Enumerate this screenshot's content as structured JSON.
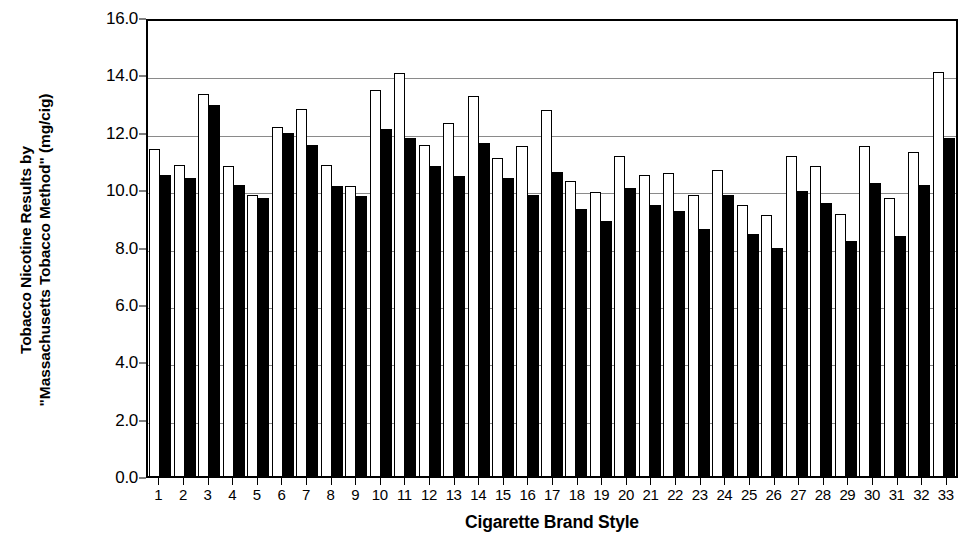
{
  "chart_data": {
    "type": "bar",
    "title": "",
    "subtitle": "",
    "ylabel_lines": [
      "Tobacco Nicotine Results by",
      "\"Massachusetts Tobacco Method\" (mg/cig)"
    ],
    "ylabel": "Tobacco Nicotine Results by \"Massachusetts Tobacco Method\" (mg/cig)",
    "xlabel": "Cigarette Brand Style",
    "ylim": [
      0.0,
      16.0
    ],
    "ytick_labels": [
      "16.0",
      "14.0",
      "12.0",
      "10.0",
      "8.0",
      "6.0",
      "4.0",
      "2.0",
      "0.0"
    ],
    "ytick_values": [
      16.0,
      14.0,
      12.0,
      10.0,
      8.0,
      6.0,
      4.0,
      2.0,
      0.0
    ],
    "grid": true,
    "grid_axis": "y",
    "legend": "none",
    "categories": [
      "1",
      "2",
      "3",
      "4",
      "5",
      "6",
      "7",
      "8",
      "9",
      "10",
      "11",
      "12",
      "13",
      "14",
      "15",
      "16",
      "17",
      "18",
      "19",
      "20",
      "21",
      "22",
      "23",
      "24",
      "25",
      "26",
      "27",
      "28",
      "29",
      "30",
      "31",
      "32",
      "33"
    ],
    "series": [
      {
        "name": "white-bar",
        "style": "open",
        "color": "#ffffff",
        "edge_color": "#000000",
        "values": [
          11.4,
          10.85,
          13.3,
          10.8,
          9.8,
          12.15,
          12.8,
          10.85,
          10.1,
          13.45,
          14.05,
          11.55,
          12.3,
          13.25,
          11.1,
          11.5,
          12.75,
          10.3,
          9.9,
          11.15,
          10.5,
          10.55,
          9.8,
          10.65,
          9.45,
          9.1,
          11.15,
          10.8,
          9.15,
          11.5,
          9.7,
          11.3,
          14.1
        ]
      },
      {
        "name": "black-bar",
        "style": "filled",
        "color": "#000000",
        "edge_color": "#000000",
        "values": [
          10.5,
          10.4,
          12.95,
          10.15,
          9.7,
          11.95,
          11.55,
          10.1,
          9.75,
          12.1,
          11.8,
          10.8,
          10.45,
          11.6,
          10.4,
          9.8,
          10.6,
          9.3,
          8.9,
          10.05,
          9.45,
          9.25,
          8.6,
          9.8,
          8.45,
          7.95,
          9.95,
          9.5,
          8.2,
          10.2,
          8.35,
          10.15,
          11.8
        ]
      }
    ]
  }
}
